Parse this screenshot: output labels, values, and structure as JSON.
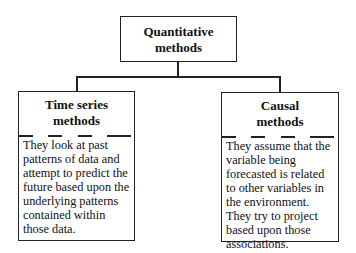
{
  "root": {
    "title_line1": "Quantitative",
    "title_line2": "methods"
  },
  "children": [
    {
      "title_line1": "Time series",
      "title_line2": "methods",
      "description": "They look at past patterns of data and attempt to predict the future based upon the underlying patterns contained within those data."
    },
    {
      "title_line1": "Causal",
      "title_line2": "methods",
      "description": "They assume that the variable being forecasted is related to other variables in the environment. They try to project based upon those associations."
    }
  ]
}
